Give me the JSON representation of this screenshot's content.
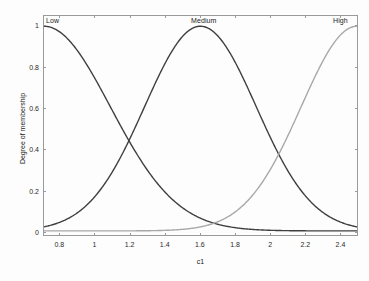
{
  "figure": {
    "background_color": "#fdfdfd",
    "axes_border_color": "#9a9a9a"
  },
  "axis": {
    "xlabel": "c1",
    "ylabel": "Degree of membership",
    "xticks": [
      "0.8",
      "1",
      "1.2",
      "1.4",
      "1.6",
      "1.8",
      "2",
      "2.2",
      "2.4"
    ],
    "yticks": [
      "0",
      "0.2",
      "0.4",
      "0.6",
      "0.8",
      "1"
    ]
  },
  "mf_labels": {
    "low": "Low",
    "medium": "Medium",
    "high": "High"
  },
  "chart_data": {
    "type": "line",
    "title": "",
    "xlabel": "c1",
    "ylabel": "Degree of membership",
    "xlim": [
      0.707,
      2.5
    ],
    "ylim": [
      -0.02,
      1.05
    ],
    "xticks": [
      0.8,
      1.0,
      1.2,
      1.4,
      1.6,
      1.8,
      2.0,
      2.2,
      2.4
    ],
    "yticks": [
      0,
      0.2,
      0.4,
      0.6,
      0.8,
      1.0
    ],
    "grid": false,
    "legend": "none",
    "annotations": [
      {
        "text": "Low",
        "x": 0.73,
        "y": 1.04,
        "align": "left"
      },
      {
        "text": "Medium",
        "x": 1.6,
        "y": 1.04,
        "align": "center"
      },
      {
        "text": "High",
        "x": 2.47,
        "y": 1.04,
        "align": "right"
      }
    ],
    "series": [
      {
        "name": "Low",
        "color": "#3f3f3f",
        "linewidth": 1.4,
        "mf_type": "gaussmf",
        "params": {
          "mean": 0.707,
          "sigma": 0.38
        },
        "x": [
          0.707,
          0.8,
          0.9,
          1.0,
          1.1,
          1.15,
          1.2,
          1.3,
          1.4,
          1.5,
          1.6,
          1.7,
          1.8,
          1.9,
          2.0,
          2.1,
          2.2,
          2.3,
          2.4,
          2.5
        ],
        "values": [
          1.0,
          0.971,
          0.903,
          0.804,
          0.686,
          0.624,
          0.562,
          0.441,
          0.33,
          0.236,
          0.16,
          0.103,
          0.063,
          0.036,
          0.02,
          0.01,
          0.005,
          0.002,
          0.001,
          0.0
        ]
      },
      {
        "name": "Medium",
        "color": "#3f3f3f",
        "linewidth": 1.4,
        "mf_type": "gaussmf",
        "params": {
          "mean": 1.603,
          "sigma": 0.32
        },
        "x": [
          0.707,
          0.8,
          0.9,
          1.0,
          1.1,
          1.15,
          1.2,
          1.3,
          1.4,
          1.5,
          1.6,
          1.7,
          1.8,
          1.9,
          2.0,
          2.06,
          2.1,
          2.2,
          2.3,
          2.4,
          2.5
        ],
        "values": [
          0.022,
          0.045,
          0.095,
          0.177,
          0.293,
          0.36,
          0.432,
          0.586,
          0.737,
          0.879,
          0.999,
          0.88,
          0.74,
          0.588,
          0.434,
          0.36,
          0.297,
          0.179,
          0.097,
          0.047,
          0.021
        ]
      },
      {
        "name": "High",
        "color": "#a8a8a8",
        "linewidth": 1.4,
        "mf_type": "gaussmf",
        "params": {
          "mean": 2.5,
          "sigma": 0.32
        },
        "x": [
          0.707,
          0.8,
          0.9,
          1.0,
          1.1,
          1.2,
          1.3,
          1.4,
          1.5,
          1.6,
          1.7,
          1.8,
          1.9,
          2.0,
          2.06,
          2.1,
          2.2,
          2.3,
          2.4,
          2.5
        ],
        "values": [
          0.0,
          0.0,
          0.0,
          0.001,
          0.002,
          0.006,
          0.014,
          0.031,
          0.063,
          0.118,
          0.203,
          0.323,
          0.47,
          0.633,
          0.728,
          0.784,
          0.898,
          0.974,
          1.0,
          1.0
        ]
      }
    ]
  }
}
